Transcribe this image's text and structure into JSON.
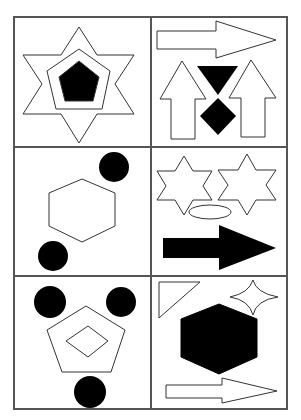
{
  "puzzle": {
    "grid": {
      "rows": 3,
      "cols": 2
    },
    "colors": {
      "stroke": "#333333",
      "fill_black": "#000000",
      "fill_white": "#ffffff",
      "border": "#555555"
    },
    "cells": [
      {
        "row": 0,
        "col": 0,
        "shapes": [
          "six-pointed star (outline)",
          "pentagon (outline)",
          "pentagon (filled black)"
        ]
      },
      {
        "row": 0,
        "col": 1,
        "shapes": [
          "right arrow (outline)",
          "up arrow (outline)",
          "up arrow (outline)",
          "down triangle (filled black)",
          "diamond (filled black)"
        ]
      },
      {
        "row": 1,
        "col": 0,
        "shapes": [
          "hexagon (outline)",
          "circle (filled black)",
          "circle (filled black)"
        ]
      },
      {
        "row": 1,
        "col": 1,
        "shapes": [
          "six-pointed star (outline)",
          "six-pointed star (outline)",
          "ellipse (outline)",
          "right arrow (filled black)"
        ]
      },
      {
        "row": 2,
        "col": 0,
        "shapes": [
          "pentagon (outline)",
          "diamond (outline)",
          "circle (filled black)",
          "circle (filled black)",
          "circle (filled black)"
        ]
      },
      {
        "row": 2,
        "col": 1,
        "shapes": [
          "right triangle (outline)",
          "four-pointed star (outline)",
          "hexagon (filled black)",
          "right arrow (outline)"
        ]
      }
    ]
  }
}
